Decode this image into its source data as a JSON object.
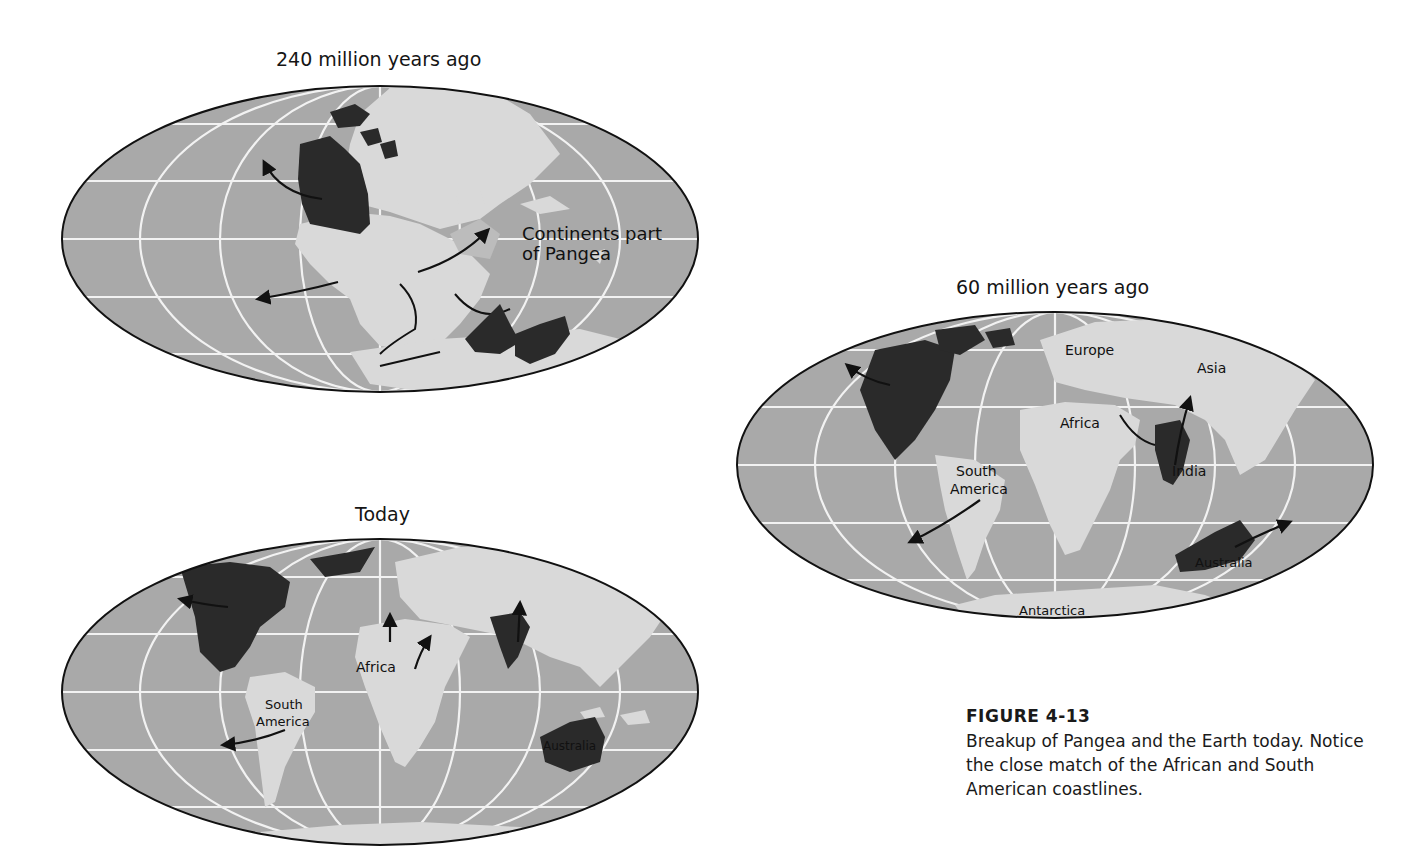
{
  "colors": {
    "ocean": "#a9a9a9",
    "land_pangea_light": "#d9d9d9",
    "continent_dark": "#2a2a2a",
    "gridlines": "#f2f2f2",
    "shelf": "#bcbcbc",
    "outline": "#111111"
  },
  "maps": {
    "pangea": {
      "title": "240 million years ago",
      "annotation": [
        "Continents part",
        "of Pangea"
      ]
    },
    "mid": {
      "title": "60 million years ago",
      "labels": {
        "europe": "Europe",
        "asia": "Asia",
        "africa": "Africa",
        "india": "India",
        "south_america": [
          "South",
          "America"
        ],
        "australia": "Australia",
        "antarctica": "Antarctica"
      }
    },
    "today": {
      "title": "Today",
      "labels": {
        "africa": "Africa",
        "south_america": [
          "South",
          "America"
        ],
        "australia": "Australia"
      }
    }
  },
  "caption": {
    "figure": "FIGURE 4-13",
    "text": "Breakup of Pangea and the Earth today. Notice the close match of the African and South American coastlines."
  }
}
